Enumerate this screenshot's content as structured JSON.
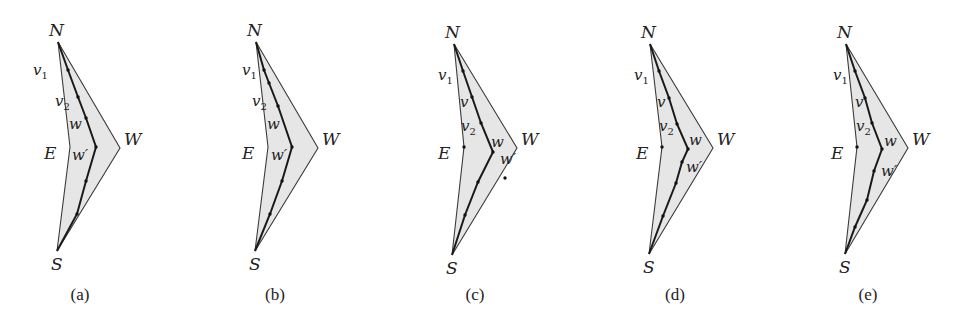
{
  "figure": {
    "panels": [
      {
        "id": "a",
        "caption": "(a)",
        "offset_x": 0,
        "labels": {
          "N": "N",
          "W": "W",
          "E": "E",
          "S": "S"
        },
        "inner_labels": [
          {
            "text": "v",
            "sub": "1",
            "x": 33,
            "y": 75
          },
          {
            "text": "v",
            "sub": "2",
            "x": 55,
            "y": 106
          },
          {
            "text": "w",
            "sub": "",
            "x": 69,
            "y": 129
          },
          {
            "text": "w′",
            "sub": "",
            "x": 72,
            "y": 160
          }
        ],
        "outer": {
          "N": [
            58,
            42
          ],
          "W": [
            120,
            148
          ],
          "S": [
            57,
            251
          ],
          "E": [
            70,
            147
          ]
        },
        "path": [
          [
            58,
            42
          ],
          [
            68,
            70
          ],
          [
            78,
            97
          ],
          [
            86,
            118
          ],
          [
            96,
            147
          ],
          [
            86,
            181
          ],
          [
            77,
            214
          ],
          [
            57,
            251
          ]
        ],
        "dots": [
          [
            68,
            70
          ],
          [
            78,
            97
          ],
          [
            86,
            118
          ],
          [
            96,
            147
          ],
          [
            86,
            181
          ],
          [
            77,
            214
          ]
        ],
        "caption_x": 80
      },
      {
        "id": "b",
        "caption": "(b)",
        "offset_x": 0,
        "labels": {
          "N": "N",
          "W": "W",
          "E": "E",
          "S": "S"
        },
        "inner_labels": [
          {
            "text": "v",
            "sub": "1",
            "x": 242,
            "y": 75
          },
          {
            "text": "v",
            "sub": "2",
            "x": 252,
            "y": 106
          },
          {
            "text": "w",
            "sub": "",
            "x": 267,
            "y": 129
          },
          {
            "text": "w′",
            "sub": "",
            "x": 271,
            "y": 160
          }
        ],
        "outer": {
          "N": [
            256,
            42
          ],
          "W": [
            318,
            148
          ],
          "S": [
            255,
            251
          ],
          "E": [
            268,
            147
          ]
        },
        "path": [
          [
            256,
            42
          ],
          [
            264,
            70
          ],
          [
            269,
            83
          ],
          [
            278,
            106
          ],
          [
            292,
            147
          ],
          [
            282,
            181
          ],
          [
            270,
            214
          ],
          [
            255,
            251
          ]
        ],
        "dots": [
          [
            264,
            70
          ],
          [
            269,
            83
          ],
          [
            278,
            106
          ],
          [
            292,
            147
          ],
          [
            282,
            181
          ],
          [
            270,
            214
          ]
        ],
        "caption_x": 275
      },
      {
        "id": "c",
        "caption": "(c)",
        "offset_x": 0,
        "labels": {
          "N": "N",
          "W": "W",
          "E": "E",
          "S": "S"
        },
        "inner_labels": [
          {
            "text": "v",
            "sub": "1",
            "x": 438,
            "y": 80
          },
          {
            "text": "v",
            "sub": "",
            "x": 460,
            "y": 107
          },
          {
            "text": "v",
            "sub": "2",
            "x": 461,
            "y": 131
          },
          {
            "text": "w",
            "sub": "",
            "x": 491,
            "y": 147
          },
          {
            "text": "w′",
            "sub": "",
            "x": 500,
            "y": 164
          }
        ],
        "outer": {
          "N": [
            454,
            44
          ],
          "W": [
            517,
            148
          ],
          "S": [
            452,
            255
          ],
          "E": [
            464,
            147
          ]
        },
        "path": [
          [
            454,
            44
          ],
          [
            463,
            71
          ],
          [
            472,
            97
          ],
          [
            481,
            123
          ],
          [
            493,
            152
          ],
          [
            478,
            182
          ],
          [
            465,
            215
          ],
          [
            452,
            255
          ]
        ],
        "dots": [
          [
            463,
            71
          ],
          [
            472,
            97
          ],
          [
            481,
            123
          ],
          [
            493,
            152
          ],
          [
            478,
            182
          ],
          [
            465,
            215
          ],
          [
            464,
            147
          ],
          [
            505,
            178
          ]
        ],
        "caption_x": 475
      },
      {
        "id": "d",
        "caption": "(d)",
        "offset_x": 0,
        "labels": {
          "N": "N",
          "W": "W",
          "E": "E",
          "S": "S"
        },
        "inner_labels": [
          {
            "text": "v",
            "sub": "1",
            "x": 634,
            "y": 80
          },
          {
            "text": "v",
            "sub": "",
            "x": 657,
            "y": 107
          },
          {
            "text": "v",
            "sub": "2",
            "x": 659,
            "y": 131
          },
          {
            "text": "w",
            "sub": "",
            "x": 689,
            "y": 145
          },
          {
            "text": "w′",
            "sub": "",
            "x": 686,
            "y": 172
          }
        ],
        "outer": {
          "N": [
            650,
            44
          ],
          "W": [
            713,
            148
          ],
          "S": [
            649,
            254
          ],
          "E": [
            662,
            147
          ]
        },
        "path": [
          [
            650,
            44
          ],
          [
            659,
            71
          ],
          [
            669,
            98
          ],
          [
            677,
            124
          ],
          [
            688,
            149
          ],
          [
            682,
            162
          ],
          [
            676,
            183
          ],
          [
            663,
            216
          ],
          [
            649,
            254
          ]
        ],
        "dots": [
          [
            659,
            71
          ],
          [
            669,
            98
          ],
          [
            677,
            124
          ],
          [
            688,
            149
          ],
          [
            682,
            162
          ],
          [
            676,
            183
          ],
          [
            663,
            216
          ],
          [
            662,
            147
          ]
        ],
        "caption_x": 675
      },
      {
        "id": "e",
        "caption": "(e)",
        "offset_x": 0,
        "labels": {
          "N": "N",
          "W": "W",
          "E": "E",
          "S": "S"
        },
        "inner_labels": [
          {
            "text": "v",
            "sub": "1",
            "x": 833,
            "y": 80
          },
          {
            "text": "v",
            "sub": "",
            "x": 855,
            "y": 107
          },
          {
            "text": "v",
            "sub": "2",
            "x": 856,
            "y": 131
          },
          {
            "text": "w",
            "sub": "",
            "x": 884,
            "y": 146
          },
          {
            "text": "w′",
            "sub": "",
            "x": 881,
            "y": 176
          }
        ],
        "outer": {
          "N": [
            846,
            44
          ],
          "W": [
            908,
            148
          ],
          "S": [
            845,
            254
          ],
          "E": [
            857,
            147
          ]
        },
        "path": [
          [
            846,
            44
          ],
          [
            855,
            71
          ],
          [
            865,
            98
          ],
          [
            872,
            123
          ],
          [
            882,
            149
          ],
          [
            874,
            171
          ],
          [
            867,
            200
          ],
          [
            855,
            227
          ],
          [
            845,
            254
          ]
        ],
        "dots": [
          [
            855,
            71
          ],
          [
            865,
            98
          ],
          [
            872,
            123
          ],
          [
            882,
            149
          ],
          [
            874,
            171
          ],
          [
            867,
            200
          ],
          [
            855,
            227
          ],
          [
            857,
            147
          ]
        ],
        "caption_x": 868
      }
    ],
    "colors": {
      "fill": "#e6e6e6",
      "stroke": "#3a3a3a",
      "path_stroke": "#1a1a1a",
      "text": "#222222"
    }
  }
}
